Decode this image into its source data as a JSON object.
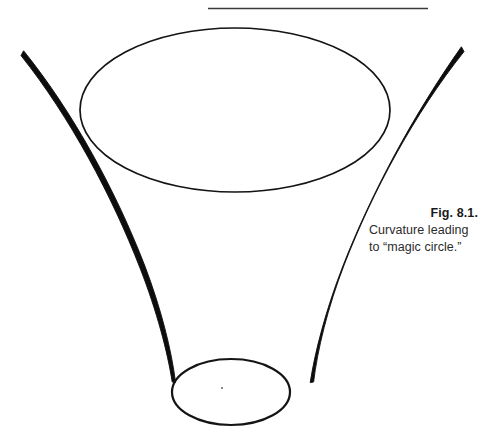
{
  "page": {
    "background_color": "#ffffff",
    "width": 485,
    "height": 444
  },
  "rule": {
    "name": "top-horizontal-rule",
    "color": "#3a3a3a",
    "x_start": 208,
    "x_end": 428,
    "y": 8,
    "thickness": 1.6
  },
  "figure": {
    "stroke_color": "#111111",
    "top_ellipse": {
      "label": "magic-circle-upper-rim",
      "cx": 235,
      "cy": 110,
      "rx": 155,
      "ry": 82,
      "stroke_width": 1.7
    },
    "bottom_ellipse": {
      "label": "funnel-lower-rim",
      "cx": 231,
      "cy": 392,
      "rx": 59,
      "ry": 33,
      "stroke_width": 2.2
    },
    "center_dot": {
      "label": "funnel-center-point",
      "cx": 222,
      "cy": 388,
      "r": 1.1,
      "color": "#6e6e6e"
    },
    "left_curve": {
      "label": "funnel-wall-left",
      "start_x": 21,
      "start_y": 57,
      "end_x": 173,
      "end_y": 384,
      "max_width": 5.2,
      "min_width": 1.6
    },
    "right_curve": {
      "label": "funnel-wall-right",
      "start_x": 464,
      "start_y": 53,
      "end_x": 289,
      "end_y": 384,
      "max_width": 5.2,
      "min_width": 1.6
    }
  },
  "caption": {
    "label": "Fig. 8.1.",
    "lines": [
      "Curvature leading",
      "to “magic circle.”"
    ],
    "line1": "Curvature leading",
    "line2": "to “magic circle.”",
    "color": "#2b2b2b"
  }
}
